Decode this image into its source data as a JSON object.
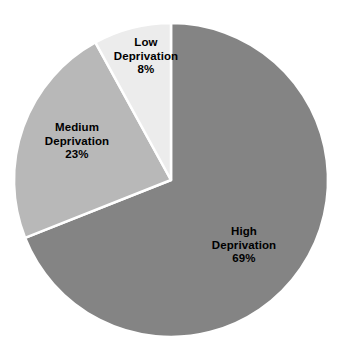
{
  "chart_data": {
    "type": "pie",
    "title": "",
    "subtitle": "",
    "xlabel": "",
    "ylabel": "",
    "legend_position": "none",
    "grid": false,
    "units": "percent",
    "total": 100,
    "start_angle_deg": 0,
    "direction": "clockwise",
    "categories": [
      "High Deprivation",
      "Medium Deprivation",
      "Low Deprivation"
    ],
    "values": [
      69,
      23,
      8
    ],
    "slices": [
      {
        "name": "High Deprivation",
        "label_line1": "High",
        "label_line2": "Deprivation",
        "value": 69,
        "percent_text": "69%",
        "color": "#848484",
        "start_angle_deg": 0,
        "end_angle_deg": 248.4
      },
      {
        "name": "Medium Deprivation",
        "label_line1": "Medium",
        "label_line2": "Deprivation",
        "value": 23,
        "percent_text": "23%",
        "color": "#b8b8b8",
        "start_angle_deg": 248.4,
        "end_angle_deg": 331.2
      },
      {
        "name": "Low Deprivation",
        "label_line1": "Low",
        "label_line2": "Deprivation",
        "value": 8,
        "percent_text": "8%",
        "color": "#ececec",
        "start_angle_deg": 331.2,
        "end_angle_deg": 360
      }
    ]
  },
  "style": {
    "background": "#ffffff",
    "separator_color": "#ffffff",
    "text_color": "#000000"
  }
}
